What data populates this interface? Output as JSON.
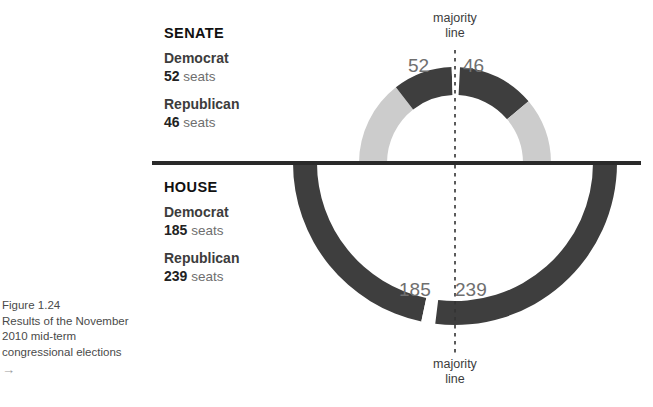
{
  "figure": {
    "caption_lines": [
      "Figure 1.24",
      "Results of the November",
      "2010 mid-term",
      "congressional elections"
    ],
    "caption_arrow": "→"
  },
  "majority_line": {
    "top_label_line1": "majority",
    "top_label_line2": "line",
    "bottom_label_line1": "majority",
    "bottom_label_line2": "line"
  },
  "senate": {
    "chamber": "SENATE",
    "democrat_label": "Democrat",
    "democrat_seats": "52",
    "democrat_unit": "seats",
    "republican_label": "Republican",
    "republican_seats": "46",
    "republican_unit": "seats",
    "arc_left_value": "52",
    "arc_right_value": "46"
  },
  "house": {
    "chamber": "HOUSE",
    "democrat_label": "Democrat",
    "democrat_seats": "185",
    "democrat_unit": "seats",
    "republican_label": "Republican",
    "republican_seats": "239",
    "republican_unit": "seats",
    "arc_left_value": "185",
    "arc_right_value": "239"
  },
  "colors": {
    "dark": "#3e3e3e",
    "light": "#cccccc",
    "divider": "#2a2a2a",
    "text_dark": "#222222",
    "text_gray": "#6f6f6f",
    "majority_dash": "#333333"
  },
  "chart_data": {
    "type": "pie",
    "title": "Results of the November 2010 mid-term congressional elections",
    "legend_position": "left",
    "charts": [
      {
        "name": "SENATE",
        "orientation": "upper-semicircle",
        "total_seats": 98,
        "majority_line_degrees": 90,
        "segments": [
          {
            "party": "Democrat",
            "seats": 52,
            "color": "#cccccc",
            "side": "left",
            "start_deg": 180,
            "end_deg": 128
          },
          {
            "party": "Democrat",
            "seats": 52,
            "color": "#3e3e3e",
            "side": "left",
            "start_deg": 128,
            "end_deg": 92
          },
          {
            "party": "gap",
            "seats": 0,
            "color": "#ffffff",
            "side": "center",
            "start_deg": 92,
            "end_deg": 87
          },
          {
            "party": "Republican",
            "seats": 46,
            "color": "#3e3e3e",
            "side": "right",
            "start_deg": 87,
            "end_deg": 40
          },
          {
            "party": "Republican",
            "seats": 46,
            "color": "#cccccc",
            "side": "right",
            "start_deg": 40,
            "end_deg": 0
          }
        ],
        "labels": {
          "left": "52",
          "right": "46"
        }
      },
      {
        "name": "HOUSE",
        "orientation": "lower-semicircle",
        "total_seats": 424,
        "majority_line_degrees": 270,
        "segments": [
          {
            "party": "Democrat",
            "seats": 185,
            "color": "#3e3e3e",
            "side": "left",
            "start_deg": 180,
            "end_deg": 258
          },
          {
            "party": "gap",
            "seats": 0,
            "color": "#ffffff",
            "side": "center",
            "start_deg": 258,
            "end_deg": 263
          },
          {
            "party": "Republican",
            "seats": 239,
            "color": "#3e3e3e",
            "side": "right",
            "start_deg": 263,
            "end_deg": 360
          }
        ],
        "labels": {
          "left": "185",
          "right": "239"
        }
      }
    ]
  }
}
